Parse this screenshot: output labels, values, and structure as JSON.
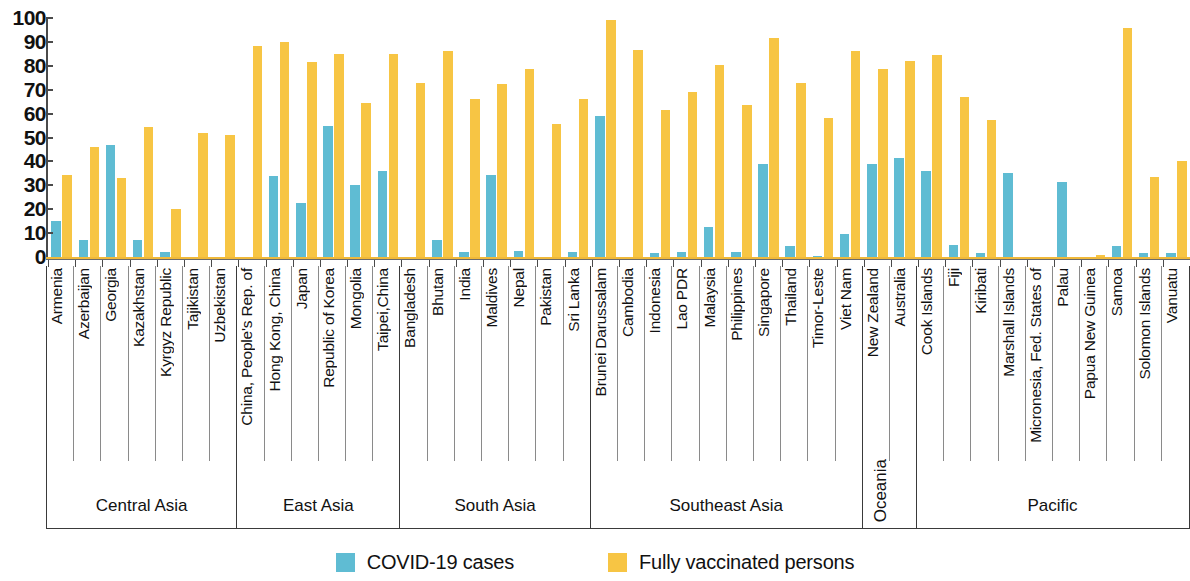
{
  "legend": {
    "items": [
      {
        "label": "COVID-19 cases",
        "color": "#5fbcd3",
        "key": "cases"
      },
      {
        "label": "Fully vaccinated persons",
        "color": "#f7c544",
        "key": "vaccinated"
      }
    ]
  },
  "axis": {
    "y_ticks": [
      "0",
      "10",
      "20",
      "30",
      "40",
      "50",
      "60",
      "70",
      "80",
      "90",
      "100"
    ]
  },
  "regions": [
    {
      "name": "Central Asia",
      "orientation": "horizontal",
      "count": 7
    },
    {
      "name": "East Asia",
      "orientation": "horizontal",
      "count": 6
    },
    {
      "name": "South Asia",
      "orientation": "horizontal",
      "count": 7
    },
    {
      "name": "Southeast Asia",
      "orientation": "horizontal",
      "count": 10
    },
    {
      "name": "Oceania",
      "orientation": "vertical",
      "count": 2
    },
    {
      "name": "Pacific",
      "orientation": "horizontal",
      "count": 10
    }
  ],
  "chart_data": {
    "type": "bar",
    "title": "",
    "xlabel": "",
    "ylabel": "",
    "ylim": [
      0,
      100
    ],
    "grid": false,
    "legend_position": "bottom",
    "categories": [
      "Armenia",
      "Azerbaijan",
      "Georgia",
      "Kazakhstan",
      "Kyrgyz Republic",
      "Tajikistan",
      "Uzbekistan",
      "China, People's Rep. of",
      "Hong Kong, China",
      "Japan",
      "Republic of Korea",
      "Mongolia",
      "Taipei,China",
      "Bangladesh",
      "Bhutan",
      "India",
      "Maldives",
      "Nepal",
      "Pakistan",
      "Sri Lanka",
      "Brunei Darussalam",
      "Cambodia",
      "Indonesia",
      "Lao PDR",
      "Malaysia",
      "Philippines",
      "Singapore",
      "Thailand",
      "Timor-Leste",
      "Viet Nam",
      "New Zealand",
      "Australia",
      "Cook Islands",
      "Fiji",
      "Kiribati",
      "Marshall Islands",
      "Micronesia, Fed. States of",
      "Palau",
      "Papua New Guinea",
      "Samoa",
      "Solomon Islands",
      "Vanuatu"
    ],
    "category_regions": [
      "Central Asia",
      "Central Asia",
      "Central Asia",
      "Central Asia",
      "Central Asia",
      "Central Asia",
      "Central Asia",
      "East Asia",
      "East Asia",
      "East Asia",
      "East Asia",
      "East Asia",
      "East Asia",
      "South Asia",
      "South Asia",
      "South Asia",
      "South Asia",
      "South Asia",
      "South Asia",
      "South Asia",
      "Southeast Asia",
      "Southeast Asia",
      "Southeast Asia",
      "Southeast Asia",
      "Southeast Asia",
      "Southeast Asia",
      "Southeast Asia",
      "Southeast Asia",
      "Southeast Asia",
      "Southeast Asia",
      "Oceania",
      "Oceania",
      "Pacific",
      "Pacific",
      "Pacific",
      "Pacific",
      "Pacific",
      "Pacific",
      "Pacific",
      "Pacific",
      "Pacific",
      "Pacific"
    ],
    "series": [
      {
        "name": "COVID-19 cases",
        "color": "#5fbcd3",
        "values": [
          15,
          7,
          47,
          7,
          2,
          0,
          0,
          0,
          34,
          22.5,
          55,
          30,
          36,
          0,
          7,
          2,
          34.5,
          2.5,
          0,
          2,
          59,
          0,
          1.5,
          2,
          12.5,
          2,
          39,
          4.5,
          0.5,
          9.5,
          39,
          41.5,
          36,
          5,
          1.5,
          35,
          0,
          31.5,
          0,
          4.5,
          1.5,
          1.5
        ]
      },
      {
        "name": "Fully vaccinated persons",
        "color": "#f7c544",
        "values": [
          34.5,
          46,
          33,
          54.5,
          20,
          52,
          51,
          88.5,
          90,
          81.5,
          85,
          64.5,
          85,
          73,
          86,
          66,
          72.5,
          78.5,
          55.5,
          66,
          99,
          86.5,
          61.5,
          69,
          80.5,
          63.5,
          91.5,
          73,
          58,
          86,
          78.5,
          82,
          84.5,
          67,
          57.5,
          0,
          0,
          0,
          1,
          96,
          33.5,
          40
        ]
      }
    ]
  }
}
